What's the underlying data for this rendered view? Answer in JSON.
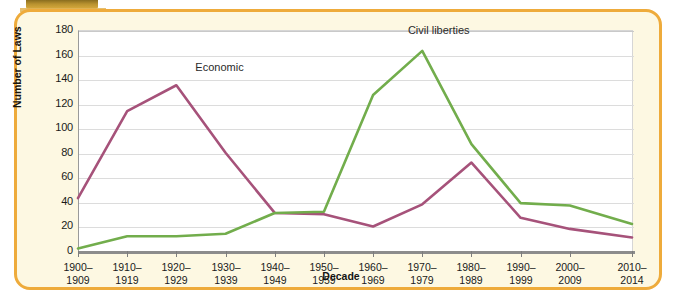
{
  "figure": {
    "panel_border_color": "#eeab3b",
    "panel_background_color": "#fdf8e2",
    "plot_background_color": "#ffffff",
    "corner_tab_color": "#b9922f"
  },
  "chart_data": {
    "type": "line",
    "title": "",
    "xlabel": "Decade",
    "ylabel": "Number of Laws",
    "categories": [
      "1900–1909",
      "1910–1919",
      "1920–1929",
      "1930–1939",
      "1940–1949",
      "1950–1959",
      "1960–1969",
      "1970–1979",
      "1980–1989",
      "1990–1999",
      "2000–2009",
      "2010–2014"
    ],
    "ylim": [
      0,
      180
    ],
    "yticks": [
      0,
      20,
      40,
      60,
      80,
      100,
      120,
      140,
      160,
      180
    ],
    "ytick_labels": [
      "0",
      "20",
      "40",
      "60",
      "80",
      "100",
      "120",
      "140",
      "160",
      "180"
    ],
    "grid": true,
    "legend": "inline-annotations",
    "series": [
      {
        "name": "Economic",
        "color": "#a6527a",
        "values": [
          43,
          114,
          135,
          80,
          31,
          30,
          20,
          38,
          72,
          27,
          18,
          11
        ],
        "annotation": {
          "text": "Economic",
          "x_pct": 25.5,
          "y_value": 148
        }
      },
      {
        "name": "Civil liberties",
        "color": "#72ad4c",
        "values": [
          2,
          12,
          12,
          14,
          31,
          32,
          127,
          163,
          87,
          39,
          37,
          22
        ],
        "annotation": {
          "text": "Civil liberties",
          "x_pct": 65.0,
          "y_value": 178
        }
      }
    ]
  }
}
